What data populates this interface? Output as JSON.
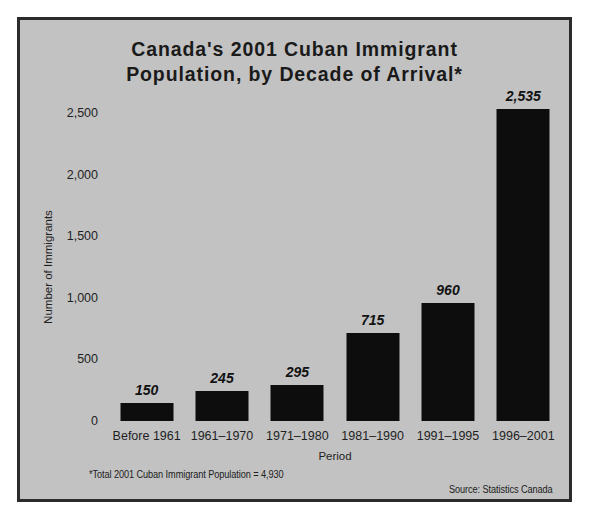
{
  "chart_data": {
    "type": "bar",
    "title": "Canada's 2001 Cuban Immigrant Population, by Decade of Arrival*",
    "title_lines": [
      "Canada's 2001 Cuban Immigrant",
      "Population, by Decade of Arrival*"
    ],
    "xlabel": "Period",
    "ylabel": "Number of Immigrants",
    "categories": [
      "Before 1961",
      "1961–1970",
      "1971–1980",
      "1981–1990",
      "1991–1995",
      "1996–2001"
    ],
    "values": [
      150,
      245,
      295,
      715,
      960,
      2535
    ],
    "value_labels": [
      "150",
      "245",
      "295",
      "715",
      "960",
      "2,535"
    ],
    "ylim": [
      0,
      2500
    ],
    "yticks": [
      0,
      500,
      1000,
      1500,
      2000,
      2500
    ],
    "ytick_labels": [
      "0",
      "500",
      "1,000",
      "1,500",
      "2,000",
      "2,500"
    ],
    "grid": false,
    "legend": null,
    "bar_color": "#0d0d0d",
    "background_color": "#c2c2c2",
    "border_color": "#2b2b2b",
    "footnote": "*Total 2001 Cuban Immigrant Population = 4,930",
    "source": "Source: Statistics Canada"
  }
}
